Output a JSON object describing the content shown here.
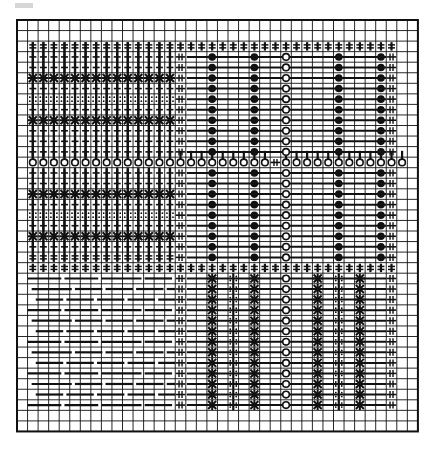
{
  "diagram": {
    "type": "weaving-draft-grid",
    "grid": {
      "x": 17,
      "y": 20,
      "cols": 38,
      "rows": 39,
      "cell": 10.55,
      "line_color": "#111111",
      "border_width": 2
    },
    "symbols": {
      "tie": "double-bar-stitch",
      "star": "x-star-stitch",
      "dotted": "dotted-stitch",
      "circle_open": "open-circle",
      "circle_filled": "filled-circle",
      "hash": "double-hash",
      "dash": "float-dash"
    },
    "regions": {
      "top_left": {
        "cols": [
          1,
          15
        ],
        "rows": [
          2,
          12
        ]
      },
      "middle_row": {
        "row": 13
      },
      "right_block": {
        "cols": [
          15,
          36
        ],
        "rows": [
          2,
          23
        ]
      },
      "bottom_left": {
        "cols": [
          1,
          15
        ],
        "rows": [
          23,
          37
        ]
      },
      "bottom_right": {
        "cols": [
          15,
          36
        ],
        "rows": [
          23,
          37
        ]
      }
    }
  }
}
